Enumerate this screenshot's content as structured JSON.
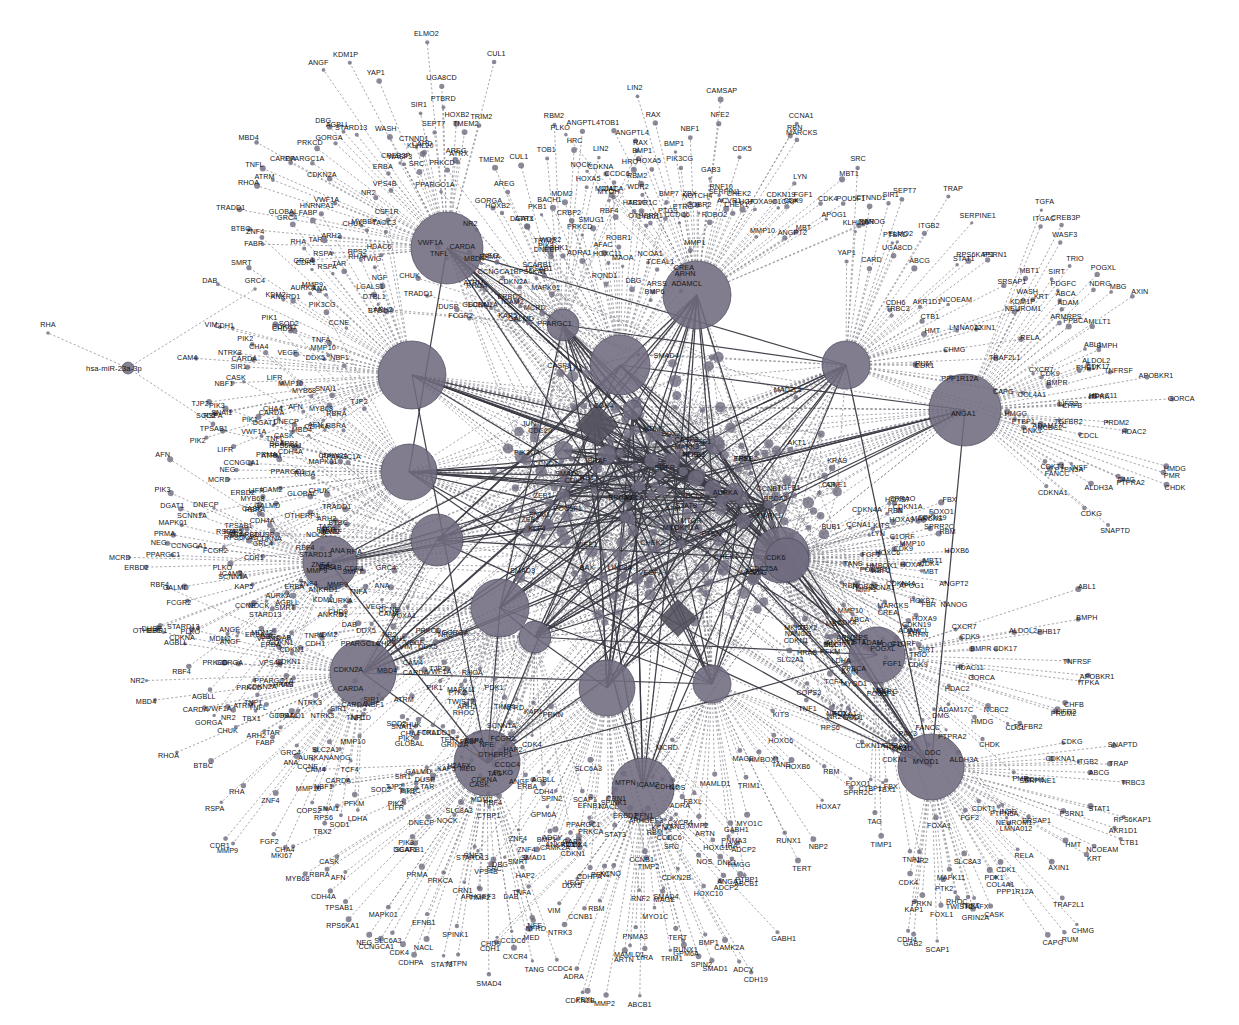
{
  "figure": {
    "type": "network-graph",
    "background_color": "#ffffff",
    "node_color": "#6f6b7e",
    "dashed_edge_color": "#7d7d86",
    "solid_edge_color": "#3a3a44",
    "label_color": "#141418",
    "width": 1239,
    "height": 1025
  },
  "legend": {
    "hub_shape": "circle",
    "leaf_shape": "circle",
    "special_shape": "diamond",
    "dashed_edge_meaning": "predicted miRNA-target interaction",
    "solid_edge_meaning": "validated protein-protein interaction"
  },
  "chart_data": {
    "type": "scatter",
    "node_count": 760,
    "hub_count": 22,
    "grid": false,
    "legend_position": "none",
    "hubs": [
      {
        "id": "hub-01",
        "label": "hsa-miR-21-5p",
        "x": 447,
        "y": 248,
        "r": 36
      },
      {
        "id": "hub-02",
        "label": "hsa-miR-155-5p",
        "x": 697,
        "y": 295,
        "r": 34
      },
      {
        "id": "hub-03",
        "label": "hsa-miR-34a-5p",
        "x": 620,
        "y": 365,
        "r": 30
      },
      {
        "id": "hub-04",
        "label": "hsa-miR-146a-5p",
        "x": 412,
        "y": 375,
        "r": 34
      },
      {
        "id": "hub-05",
        "label": "hsa-miR-1-3p",
        "x": 965,
        "y": 410,
        "r": 36
      },
      {
        "id": "hub-06",
        "label": "hsa-miR-124-3p",
        "x": 846,
        "y": 365,
        "r": 24
      },
      {
        "id": "hub-07",
        "label": "hsa-miR-145-5p",
        "x": 563,
        "y": 325,
        "r": 16
      },
      {
        "id": "hub-08",
        "label": "hsa-miR-16-5p",
        "x": 409,
        "y": 472,
        "r": 28
      },
      {
        "id": "hub-09",
        "label": "hsa-miR-17-5p",
        "x": 437,
        "y": 540,
        "r": 26
      },
      {
        "id": "hub-10",
        "label": "hsa-miR-29a-3p",
        "x": 330,
        "y": 563,
        "r": 27
      },
      {
        "id": "hub-11",
        "label": "hsa-miR-126-3p",
        "x": 500,
        "y": 608,
        "r": 29
      },
      {
        "id": "hub-12",
        "label": "hsa-miR-200b-3p",
        "x": 535,
        "y": 637,
        "r": 16
      },
      {
        "id": "hub-13",
        "label": "hsa-miR-19b-3p",
        "x": 607,
        "y": 688,
        "r": 28
      },
      {
        "id": "hub-14",
        "label": "hsa-miR-133a-3p",
        "x": 712,
        "y": 684,
        "r": 19
      },
      {
        "id": "hub-15",
        "label": "hsa-miR-221-3p",
        "x": 781,
        "y": 555,
        "r": 28
      },
      {
        "id": "hub-16",
        "label": "hsa-miR-143-3p",
        "x": 877,
        "y": 655,
        "r": 28
      },
      {
        "id": "hub-17",
        "label": "hsa-miR-223-3p",
        "x": 931,
        "y": 767,
        "r": 33
      },
      {
        "id": "hub-18",
        "label": "hsa-miR-150-5p",
        "x": 487,
        "y": 763,
        "r": 33
      },
      {
        "id": "hub-19",
        "label": "hsa-miR-93-5p",
        "x": 643,
        "y": 789,
        "r": 31
      },
      {
        "id": "hub-20",
        "label": "hsa-miR-103a-3p",
        "x": 363,
        "y": 673,
        "r": 33
      },
      {
        "id": "hub-21",
        "label": "hsa-miR-210-3p",
        "x": 787,
        "y": 560,
        "r": 22
      },
      {
        "id": "hub-22",
        "label": "hsa-miR-23a-3p",
        "x": 128,
        "y": 368,
        "r": 6
      }
    ],
    "center_cluster": {
      "x": 660,
      "y": 490,
      "radius": 150,
      "dense_nodes": 190
    },
    "leaf_labels_top": [
      "CREB3P",
      "WASH",
      "KDM1P",
      "WASF3",
      "YAP1",
      "SRC",
      "KLHL20",
      "CTNND1",
      "CARD",
      "SIR1",
      "SEPT7",
      "ELMO2",
      "PTBRD",
      "UGA8CD",
      "HOXB2",
      "AREG",
      "TMEM2",
      "ATRX",
      "CUL1",
      "TRIM2",
      "WDR2",
      "TOB1",
      "RBM2",
      "HRC",
      "ANGPTL4",
      "HOXA5",
      "LIN2",
      "CCDC6",
      "RAX",
      "BMP1",
      "PIK3CG",
      "PTRG",
      "NBF1",
      "ZBX",
      "COBR2",
      "NOTCH4",
      "NFE2",
      "GAB3",
      "CAMSAP",
      "RNF10",
      "SERPIN1",
      "ACVR1",
      "CDK5",
      "CHEK1",
      "CHEK2",
      "HGF",
      "PKB1",
      "CHK1",
      "BACH1",
      "ADRA1",
      "CRBP2",
      "MDM2",
      "PRKCD",
      "SMUG1",
      "RQND1",
      "AFAC",
      "MYOH",
      "HOXC11",
      "CACA",
      "ROBR1",
      "MAOA",
      "HTR2C",
      "ACVR1C",
      "DBG",
      "CYB01",
      "BMP7",
      "NCOA1",
      "PTGS",
      "TCEAL1",
      "ARSS",
      "BMP6",
      "HNRNPA1",
      "LGALS1",
      "RPS2",
      "DTBL1",
      "NGF",
      "TWIG",
      "MYBBP",
      "HDAC6",
      "CSF1R",
      "TAOC3",
      "TGFA",
      "ITGAC",
      "MBT1"
    ],
    "leaf_labels_right": [
      "CCNA1",
      "RBN",
      "HOXA9",
      "MARCKS",
      "CDKN19",
      "LYN",
      "C1ORF",
      "CDK9",
      "MMP10",
      "FGF1",
      "CDK4",
      "MBT1",
      "MBT",
      "POU5F1",
      "ANGPT2",
      "APOG1",
      "FBR",
      "NANOG",
      "MMP1",
      "ROBO2",
      "CREA",
      "ARHN",
      "ADAMCL",
      "SIRT",
      "TRIO",
      "PDGFC",
      "ABCA",
      "ADAM",
      "POGXL",
      "ARMRPS",
      "NDRG",
      "MBG",
      "PPBCA",
      "AXIN",
      "MLLT1",
      "ABL1",
      "CXCR7",
      "CDK9",
      "BMPH",
      "ALDOL2",
      "PHB17",
      "CDK17",
      "BMPR",
      "TNFRSF",
      "APOBKR1",
      "HDAC11",
      "ITPKA",
      "GORCA",
      "LIFR2",
      "CHFB",
      "PRDM2",
      "HDAC2",
      "TGFBR2",
      "NCBC2",
      "CDCL",
      "ADAM17C",
      "HMDG",
      "CHDK",
      "PMR",
      "DMG",
      "PTPRA2",
      "INSF",
      "PTPN5A",
      "ALDH3A",
      "CDKT1",
      "FANCC",
      "CDKG",
      "SNAPTD",
      "CDKNA1",
      "ITGB2",
      "TRAP",
      "ABCG",
      "CDH6",
      "TRBC3",
      "SERPINE1",
      "STAT1",
      "RPS6KAP1",
      "PSRN1",
      "AKR1D1",
      "CTB1",
      "NCOEAM",
      "SRSAP1",
      "HMT",
      "KRT",
      "NEUROM1",
      "LMNA012",
      "AXIN1",
      "RELA",
      "CHMG",
      "TRAF2L1",
      "RUM",
      "CDK1",
      "PPP1R12A",
      "CAPG",
      "COL4A1",
      "HMGG",
      "PTBP1",
      "DNK1",
      "ANGA1",
      "GABH1",
      "ADCP2",
      "NOS",
      "HOXC10",
      "CDH19",
      "SPRAO",
      "CDKN1A",
      "KITS",
      "FBX",
      "FOXO1",
      "SPRR2C",
      "RBM",
      "HOXC6",
      "HOXB6",
      "HOXA7",
      "TANS",
      "HMBOX1",
      "NBP2",
      "CDKN4A",
      "HOXB7"
    ],
    "leaf_labels_left": [
      "GRC4",
      "RHA",
      "RSPA",
      "FABP",
      "TAR",
      "BTBC",
      "ARH2",
      "TRADD1",
      "GLOBAL",
      "CHUK",
      "RHOA",
      "ATRM",
      "TNFL",
      "VWF1A",
      "CARDA",
      "MBD4",
      "CDKN2A",
      "PPARGC1A",
      "NR2",
      "PRKCD",
      "GORGA",
      "VPS4B",
      "DBG",
      "AGBLL",
      "ERBA",
      "STARD13",
      "ANGF",
      "RBF4",
      "MDM2",
      "NOCK",
      "PLKO",
      "CDKNA",
      "OTHERP1",
      "DUSP",
      "FCGR2",
      "KAP5",
      "GALMD",
      "SCNN1A",
      "ICAM2",
      "ERBD2",
      "MCRD",
      "PPARGC1",
      "CCNGCA1",
      "NEG",
      "PRMA",
      "MAPK01",
      "RPS6KA1",
      "SCARB1",
      "TPSAB1",
      "DGAT1",
      "PIK3",
      "DNECP",
      "CDH4A",
      "AFN",
      "CASK",
      "RBRA",
      "MYB68",
      "LIFR",
      "PIK2",
      "CHA4",
      "PIK1",
      "SNAI1",
      "SOD2",
      "TJP2",
      "MMP10",
      "NBF1",
      "SIR1",
      "CARDA",
      "CAM4",
      "NTRK3",
      "DDX5",
      "VEGF",
      "VIM",
      "CDH1",
      "CHD9",
      "CDKN1",
      "TNFA",
      "DAB",
      "KDM2",
      "ANKRD1",
      "SMRT",
      "CCNE",
      "AURKA",
      "MMP9",
      "ZNF4",
      "ANA",
      "CDR1"
    ],
    "leaf_labels_bottom": [
      "FOXA1",
      "NR1D",
      "NR2",
      "HRAS",
      "CDKN1",
      "TNF1",
      "TBX1",
      "TIMP1",
      "TAG",
      "CTBP1",
      "PDK1",
      "CASK",
      "SLC8A3",
      "H2AFX",
      "GRIN2A",
      "TERT",
      "RHOC",
      "TWIST2",
      "MAPK11",
      "PTK2",
      "FOXL1",
      "SCAP1",
      "PRKN",
      "GAB2",
      "CDH4",
      "KAP1",
      "CDK4",
      "ZNF4",
      "HAP2",
      "CCDC4",
      "NFRD",
      "NFE",
      "MED",
      "TANG",
      "CXCR4",
      "CCDC6",
      "SRC",
      "SMAD4",
      "ARHGEF3",
      "TIMP2",
      "RNF2",
      "MTPN",
      "CRN1",
      "SPINK1",
      "STAT3",
      "NACL",
      "CDHPA",
      "EFNB1",
      "PRKCA",
      "CDK4",
      "SLC6A3",
      "CAMK2A",
      "ADCY",
      "BMP1",
      "SMAD1",
      "SPIN2",
      "GPM6A",
      "TERT",
      "RUNX1",
      "MAGE",
      "TRIM1",
      "MYO1C",
      "ABCB1",
      "LIRA",
      "PNMA3",
      "MAMLD1",
      "ARTN",
      "MMP2",
      "FBXL",
      "CDKN2B",
      "ADRA",
      "KCNQ",
      "RBM",
      "CCNB1",
      "PFN1",
      "LDHA",
      "PFKM",
      "SOD1",
      "TCF4",
      "TBX2",
      "RPS6",
      "NANOG",
      "COPS2",
      "MKI67",
      "SLC2A1",
      "FGF2",
      "DDC",
      "MYOD1",
      "PAX3"
    ],
    "leaf_labels_inner": [
      "CDKN1A",
      "CCND1",
      "CCNE1",
      "MYC",
      "TP53",
      "RB1",
      "E2F1",
      "PTEN",
      "AKT1",
      "PIK3CA",
      "MAPK1",
      "MAPK3",
      "JUN",
      "FOS",
      "STAT3",
      "NFKB1",
      "RELA",
      "SMAD2",
      "SMAD3",
      "SMAD4",
      "TGFB1",
      "VEGFA",
      "EGFR",
      "ERBB2",
      "KRAS",
      "BRAF",
      "MTOR",
      "CDK2",
      "CDK4",
      "CDK6",
      "BCL2",
      "BAX",
      "CASP3",
      "CASP9",
      "MDM2",
      "ATM",
      "BRCA1",
      "BRCA2",
      "CHEK1",
      "CHEK2",
      "WEE1",
      "AURKA",
      "PLK1",
      "BUB1",
      "MAD2L1",
      "CCNB1",
      "CDC25A",
      "CDC20",
      "ESR1",
      "AR",
      "SOX2",
      "POU5F1",
      "NANOG",
      "KLF4",
      "LIN28A",
      "ZEB1",
      "ZEB2",
      "SNAI1",
      "SNAI2",
      "TWIST1",
      "CDH1",
      "CDH2",
      "VIM",
      "FN1",
      "MMP2",
      "MMP9",
      "TIMP1",
      "TIMP2",
      "SPARC",
      "THBS1",
      "HIF1A",
      "SLC2A1",
      "LDHA",
      "PKM",
      "G6PD",
      "IDH1",
      "SDHB",
      "FH",
      "VHL",
      "EPAS1",
      "IL6",
      "TNF",
      "IL1B",
      "CXCL8",
      "CCL2",
      "TLR4",
      "MYD88",
      "IRAK1",
      "TRAF6",
      "NFKBIA"
    ]
  }
}
